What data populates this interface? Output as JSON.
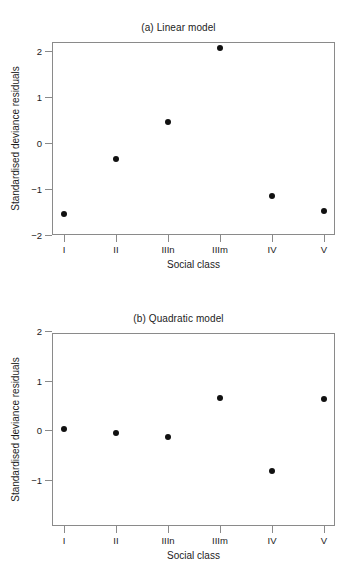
{
  "figure": {
    "xlabel": "Social class",
    "ylabel": "Standardised deviance residuals",
    "categories": [
      "I",
      "II",
      "IIIn",
      "IIIm",
      "IV",
      "V"
    ]
  },
  "chart_data": [
    {
      "type": "scatter",
      "title": "(a) Linear model",
      "xlabel": "Social class",
      "ylabel": "Standardised deviance residuals",
      "categories": [
        "I",
        "II",
        "IIIn",
        "IIIm",
        "IV",
        "V"
      ],
      "values": [
        -1.55,
        -0.35,
        0.45,
        2.07,
        -1.15,
        -1.48
      ],
      "yticks": [
        2,
        1,
        0,
        -1,
        -2
      ],
      "ytick_labels": [
        "2",
        "1",
        "0",
        "−1",
        "−2"
      ],
      "ylim": [
        -2.0,
        2.2
      ],
      "grid": false,
      "legend": "none",
      "marker": "filled-circle",
      "marker_color": "#111111"
    },
    {
      "type": "scatter",
      "title": "(b) Quadratic model",
      "xlabel": "Social class",
      "ylabel": "Standardised deviance residuals",
      "categories": [
        "I",
        "II",
        "IIIn",
        "IIIm",
        "IV",
        "V"
      ],
      "values": [
        0.03,
        -0.07,
        -0.15,
        0.65,
        -0.83,
        0.63
      ],
      "yticks": [
        2,
        1,
        0,
        -1
      ],
      "ytick_labels": [
        "2",
        "1",
        "0",
        "−1"
      ],
      "ylim": [
        -1.45,
        2.2
      ],
      "grid": false,
      "legend": "none",
      "marker": "filled-circle",
      "marker_color": "#111111"
    }
  ]
}
